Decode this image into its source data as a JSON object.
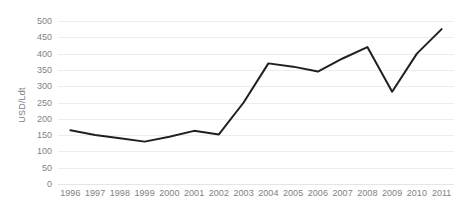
{
  "chart_data": {
    "type": "line",
    "title": "",
    "subtitle": "",
    "xlabel": "",
    "ylabel": "USD/Ldt",
    "categories": [
      "1996",
      "1997",
      "1998",
      "1999",
      "2000",
      "2001",
      "2002",
      "2003",
      "2004",
      "2005",
      "2006",
      "2007",
      "2008",
      "2009",
      "2010",
      "2011"
    ],
    "values": [
      165,
      150,
      140,
      130,
      145,
      163,
      152,
      250,
      370,
      360,
      345,
      385,
      420,
      283,
      400,
      475
    ],
    "series": [
      {
        "name": "USD/Ldt",
        "values": [
          165,
          150,
          140,
          130,
          145,
          163,
          152,
          250,
          370,
          360,
          345,
          385,
          420,
          283,
          400,
          475
        ]
      }
    ],
    "x": [
      "1996",
      "1997",
      "1998",
      "1999",
      "2000",
      "2001",
      "2002",
      "2003",
      "2004",
      "2005",
      "2006",
      "2007",
      "2008",
      "2009",
      "2010",
      "2011"
    ],
    "ylim": [
      0,
      500
    ],
    "yticks": [
      0,
      50,
      100,
      150,
      200,
      250,
      300,
      350,
      400,
      450,
      500
    ],
    "ytick_labels": [
      "0",
      "50",
      "100",
      "150",
      "200",
      "250",
      "300",
      "350",
      "400",
      "450",
      "500"
    ],
    "xtick_labels": [
      "1996",
      "1997",
      "1998",
      "1999",
      "2000",
      "2001",
      "2002",
      "2003",
      "2004",
      "2005",
      "2006",
      "2007",
      "2008",
      "2009",
      "2010",
      "2011"
    ],
    "grid": true,
    "grid_axis": "y",
    "legend": false,
    "legend_position": "none",
    "annotations": [],
    "colors": {
      "line": "#231f20",
      "grid": "#eceded",
      "tick_text": "#808285",
      "axis_title": "#808285",
      "background": "#ffffff"
    },
    "line_width": 2.0
  }
}
